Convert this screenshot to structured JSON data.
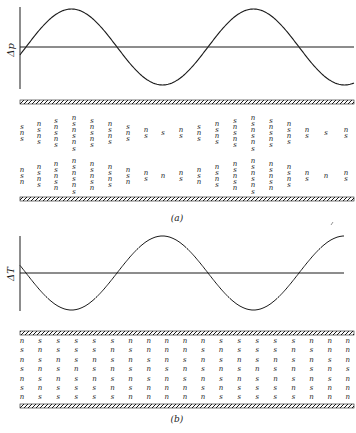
{
  "figure": {
    "panel_a": {
      "label": "(a)",
      "y_axis_label": "Δp",
      "curve": "sinusoid, ~1.9 periods, starts below axis rising",
      "columns": [
        {
          "x": 22,
          "top": [
            "s",
            "n",
            "s"
          ],
          "bottom": [
            "n",
            "s",
            "n"
          ]
        },
        {
          "x": 39,
          "top": [
            "n",
            "s",
            "n",
            "s"
          ],
          "bottom": [
            "n",
            "s",
            "n",
            "s"
          ]
        },
        {
          "x": 56,
          "top": [
            "s",
            "n",
            "s",
            "n",
            "s"
          ],
          "bottom": [
            "n",
            "s",
            "n",
            "s",
            "n"
          ]
        },
        {
          "x": 74,
          "top": [
            "n",
            "s",
            "n",
            "s",
            "n",
            "s"
          ],
          "bottom": [
            "n",
            "s",
            "n",
            "s",
            "n",
            "s"
          ]
        },
        {
          "x": 92,
          "top": [
            "s",
            "n",
            "s",
            "n",
            "s"
          ],
          "bottom": [
            "n",
            "s",
            "n",
            "s",
            "n"
          ]
        },
        {
          "x": 110,
          "top": [
            "n",
            "s",
            "n",
            "s"
          ],
          "bottom": [
            "n",
            "s",
            "n",
            "s"
          ]
        },
        {
          "x": 128,
          "top": [
            "s",
            "n",
            "s"
          ],
          "bottom": [
            "n",
            "s",
            "n"
          ]
        },
        {
          "x": 146,
          "top": [
            "n",
            "s"
          ],
          "bottom": [
            "n",
            "s"
          ]
        },
        {
          "x": 163,
          "top": [
            "s"
          ],
          "bottom": [
            "n"
          ]
        },
        {
          "x": 181,
          "top": [
            "n",
            "s"
          ],
          "bottom": [
            "n",
            "s"
          ]
        },
        {
          "x": 199,
          "top": [
            "s",
            "n",
            "s"
          ],
          "bottom": [
            "n",
            "s",
            "n"
          ]
        },
        {
          "x": 217,
          "top": [
            "n",
            "s",
            "n",
            "s"
          ],
          "bottom": [
            "n",
            "s",
            "n",
            "s"
          ]
        },
        {
          "x": 235,
          "top": [
            "s",
            "n",
            "s",
            "n",
            "s"
          ],
          "bottom": [
            "n",
            "s",
            "n",
            "s",
            "n"
          ]
        },
        {
          "x": 253,
          "top": [
            "n",
            "s",
            "n",
            "s",
            "n",
            "s"
          ],
          "bottom": [
            "n",
            "s",
            "n",
            "s",
            "n",
            "s"
          ]
        },
        {
          "x": 271,
          "top": [
            "s",
            "n",
            "s",
            "n",
            "s"
          ],
          "bottom": [
            "n",
            "s",
            "n",
            "s",
            "n"
          ]
        },
        {
          "x": 289,
          "top": [
            "n",
            "s",
            "n",
            "s"
          ],
          "bottom": [
            "n",
            "s",
            "n",
            "s"
          ]
        },
        {
          "x": 307,
          "top": [
            "n",
            "s"
          ],
          "bottom": [
            "n",
            "s"
          ]
        },
        {
          "x": 326,
          "top": [
            "s"
          ],
          "bottom": [
            "n"
          ]
        },
        {
          "x": 346,
          "top": [
            "n",
            "s"
          ],
          "bottom": [
            "n",
            "s"
          ]
        }
      ]
    },
    "panel_b": {
      "label": "(b)",
      "y_axis_label": "ΔT",
      "curve": "sinusoid, ~1.9 periods, starts above axis falling",
      "rows": [
        [
          "n",
          "s",
          "s",
          "s",
          "s",
          "s",
          "n",
          "n",
          "n",
          "n",
          "n",
          "s",
          "s",
          "s",
          "s",
          "s",
          "n",
          "n",
          "n"
        ],
        [
          "s",
          "n",
          "s",
          "s",
          "s",
          "n",
          "s",
          "n",
          "n",
          "n",
          "s",
          "n",
          "s",
          "s",
          "s",
          "n",
          "s",
          "n",
          "n"
        ],
        [
          "n",
          "s",
          "n",
          "s",
          "n",
          "s",
          "n",
          "s",
          "n",
          "s",
          "n",
          "s",
          "n",
          "s",
          "n",
          "s",
          "n",
          "s",
          "n"
        ],
        [
          "s",
          "n",
          "s",
          "n",
          "s",
          "n",
          "s",
          "n",
          "s",
          "n",
          "s",
          "n",
          "s",
          "n",
          "s",
          "n",
          "s",
          "n",
          "s"
        ],
        [
          "n",
          "s",
          "n",
          "s",
          "n",
          "s",
          "n",
          "s",
          "n",
          "s",
          "n",
          "s",
          "n",
          "s",
          "n",
          "s",
          "n",
          "s",
          "n"
        ],
        [
          "s",
          "n",
          "s",
          "s",
          "s",
          "n",
          "s",
          "n",
          "n",
          "n",
          "s",
          "n",
          "s",
          "s",
          "s",
          "n",
          "s",
          "n",
          "n"
        ],
        [
          "n",
          "s",
          "s",
          "s",
          "s",
          "s",
          "n",
          "n",
          "n",
          "n",
          "n",
          "s",
          "s",
          "s",
          "s",
          "s",
          "n",
          "n",
          "n"
        ]
      ]
    },
    "colors": {
      "ink": "#1a1a1a",
      "paper": "#ffffff"
    }
  }
}
